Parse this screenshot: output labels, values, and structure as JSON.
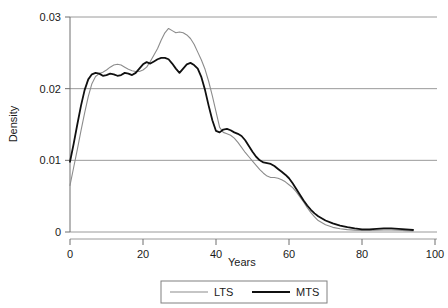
{
  "chart_data": {
    "type": "line",
    "title": "",
    "xlabel": "Years",
    "ylabel": "Density",
    "xlim": [
      0,
      100
    ],
    "ylim": [
      0,
      0.03
    ],
    "xticks": [
      0,
      20,
      40,
      60,
      80,
      100
    ],
    "xtick_labels": [
      "0",
      "20",
      "40",
      "60",
      "80",
      "100"
    ],
    "yticks": [
      0,
      0.01,
      0.02,
      0.03
    ],
    "ytick_labels": [
      "0",
      "0.01",
      "0.02",
      "0.03"
    ],
    "grid": "horizontal",
    "legend_position": "bottom-center",
    "series": [
      {
        "name": "LTS",
        "color": "#8c8c8c",
        "width": 1.1,
        "x": [
          0,
          1,
          2,
          3,
          4,
          5,
          6,
          7,
          8,
          9,
          10,
          11,
          12,
          13,
          14,
          15,
          16,
          17,
          18,
          19,
          20,
          21,
          22,
          23,
          24,
          25,
          26,
          27,
          28,
          29,
          30,
          31,
          32,
          33,
          34,
          35,
          36,
          37,
          38,
          39,
          40,
          41,
          42,
          43,
          44,
          45,
          46,
          47,
          48,
          49,
          50,
          51,
          52,
          53,
          54,
          55,
          56,
          57,
          58,
          59,
          60,
          61,
          62,
          63,
          64,
          65,
          66,
          67,
          68,
          70,
          72,
          74,
          76,
          78,
          80,
          82,
          84,
          86,
          88,
          90,
          92,
          94
        ],
        "y": [
          0.0065,
          0.009,
          0.0115,
          0.0141,
          0.0166,
          0.0189,
          0.0207,
          0.0217,
          0.0221,
          0.0223,
          0.0226,
          0.023,
          0.0233,
          0.0234,
          0.0233,
          0.023,
          0.0227,
          0.0225,
          0.0224,
          0.0224,
          0.0226,
          0.023,
          0.0238,
          0.0247,
          0.0256,
          0.0268,
          0.0278,
          0.0284,
          0.0281,
          0.0278,
          0.0279,
          0.0278,
          0.0275,
          0.027,
          0.0262,
          0.0251,
          0.024,
          0.0227,
          0.021,
          0.019,
          0.0168,
          0.0146,
          0.0139,
          0.0137,
          0.0135,
          0.0131,
          0.0125,
          0.0118,
          0.0111,
          0.0105,
          0.0099,
          0.0093,
          0.0087,
          0.0082,
          0.0078,
          0.0076,
          0.0076,
          0.0075,
          0.0073,
          0.007,
          0.0066,
          0.0062,
          0.0056,
          0.0049,
          0.0042,
          0.0034,
          0.0027,
          0.0021,
          0.0016,
          0.001,
          0.00065,
          0.00045,
          0.00033,
          0.00026,
          0.00022,
          0.00022,
          0.00024,
          0.00027,
          0.00027,
          0.00024,
          0.00019,
          0.00013
        ]
      },
      {
        "name": "MTS",
        "color": "#101010",
        "width": 1.8,
        "x": [
          0,
          1,
          2,
          3,
          4,
          5,
          6,
          7,
          8,
          9,
          10,
          11,
          12,
          13,
          14,
          15,
          16,
          17,
          18,
          19,
          20,
          21,
          22,
          23,
          24,
          25,
          26,
          27,
          28,
          29,
          30,
          31,
          32,
          33,
          34,
          35,
          36,
          37,
          38,
          39,
          40,
          41,
          42,
          43,
          44,
          45,
          46,
          47,
          48,
          49,
          50,
          51,
          52,
          53,
          54,
          55,
          56,
          57,
          58,
          59,
          60,
          61,
          62,
          63,
          64,
          65,
          66,
          67,
          68,
          70,
          72,
          74,
          76,
          78,
          80,
          82,
          84,
          86,
          88,
          90,
          92,
          94
        ],
        "y": [
          0.0098,
          0.0123,
          0.015,
          0.0176,
          0.0198,
          0.0213,
          0.022,
          0.0222,
          0.0221,
          0.0218,
          0.0219,
          0.0221,
          0.022,
          0.0218,
          0.0219,
          0.0222,
          0.0221,
          0.0219,
          0.0222,
          0.0228,
          0.0234,
          0.0237,
          0.0235,
          0.0238,
          0.0241,
          0.0243,
          0.0243,
          0.0241,
          0.0235,
          0.0228,
          0.0222,
          0.0228,
          0.0234,
          0.0236,
          0.0233,
          0.0228,
          0.0216,
          0.0198,
          0.0176,
          0.0156,
          0.0141,
          0.0139,
          0.0143,
          0.0144,
          0.0142,
          0.0139,
          0.0137,
          0.0134,
          0.0128,
          0.012,
          0.0112,
          0.0105,
          0.01,
          0.0097,
          0.0096,
          0.0095,
          0.0092,
          0.0088,
          0.0084,
          0.008,
          0.0075,
          0.0068,
          0.006,
          0.0052,
          0.0044,
          0.0037,
          0.0031,
          0.0026,
          0.0022,
          0.0016,
          0.0012,
          0.0009,
          0.00068,
          0.0005,
          0.00038,
          0.00038,
          0.00044,
          0.0005,
          0.0005,
          0.00045,
          0.00037,
          0.00028
        ]
      }
    ]
  },
  "legend": {
    "items": [
      {
        "label": "LTS",
        "color": "#8c8c8c",
        "width": 1.1
      },
      {
        "label": "MTS",
        "color": "#101010",
        "width": 1.8
      }
    ]
  },
  "axes": {
    "ylabel": "Density",
    "xlabel": "Years"
  }
}
